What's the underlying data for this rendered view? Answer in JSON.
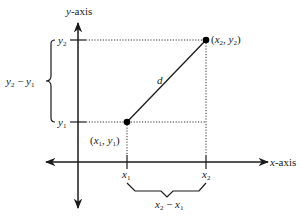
{
  "diagram": {
    "axes": {
      "y_label_var": "y",
      "y_label_suffix": "-axis",
      "x_label_var": "x",
      "x_label_suffix": "-axis"
    },
    "points": [
      {
        "name": "P1",
        "label_open": "(",
        "var_x": "x",
        "sub_x": "1",
        "comma": ", ",
        "var_y": "y",
        "sub_y": "1",
        "label_close": ")"
      },
      {
        "name": "P2",
        "label_open": "(",
        "var_x": "x",
        "sub_x": "2",
        "comma": ", ",
        "var_y": "y",
        "sub_y": "2",
        "label_close": ")"
      }
    ],
    "ticks": {
      "y2": {
        "var": "y",
        "sub": "2"
      },
      "y1": {
        "var": "y",
        "sub": "1"
      },
      "x1": {
        "var": "x",
        "sub": "1"
      },
      "x2": {
        "var": "x",
        "sub": "2"
      }
    },
    "segment_label": "d",
    "vertical_diff": {
      "a_var": "y",
      "a_sub": "2",
      "minus": " − ",
      "b_var": "y",
      "b_sub": "1"
    },
    "horizontal_diff": {
      "a_var": "x",
      "a_sub": "2",
      "minus": " − ",
      "b_var": "x",
      "b_sub": "1"
    },
    "colors": {
      "line": "#1a1a1a",
      "dotted": "#333333"
    }
  }
}
